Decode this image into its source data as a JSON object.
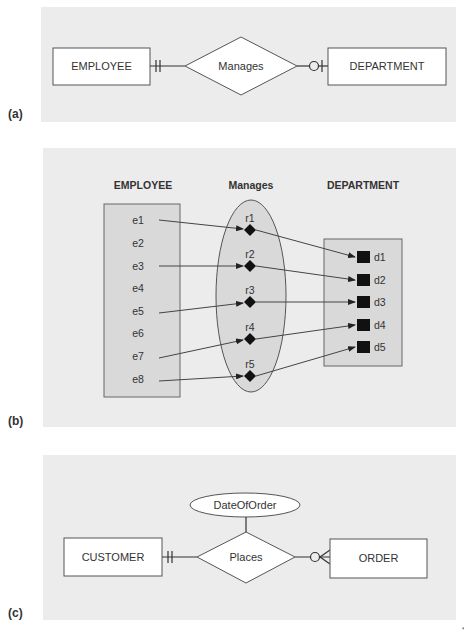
{
  "panels": {
    "a": {
      "label": "(a)",
      "entity_left": "EMPLOYEE",
      "relationship": "Manages",
      "entity_right": "DEPARTMENT",
      "left_cardinality": "one-and-only-one",
      "right_cardinality": "zero-or-one"
    },
    "b": {
      "label": "(b)",
      "headers": {
        "employee": "EMPLOYEE",
        "manages": "Manages",
        "department": "DEPARTMENT"
      },
      "employees": [
        "e1",
        "e2",
        "e3",
        "e4",
        "e5",
        "e6",
        "e7",
        "e8"
      ],
      "relationships": [
        "r1",
        "r2",
        "r3",
        "r4",
        "r5"
      ],
      "departments": [
        "d1",
        "d2",
        "d3",
        "d4",
        "d5"
      ],
      "mappings": [
        {
          "employee": "e1",
          "relationship": "r1",
          "department": "d1"
        },
        {
          "employee": "e3",
          "relationship": "r2",
          "department": "d2"
        },
        {
          "employee": "e5",
          "relationship": "r3",
          "department": "d3"
        },
        {
          "employee": "e7",
          "relationship": "r4",
          "department": "d4"
        },
        {
          "employee": "e8",
          "relationship": "r5",
          "department": "d5"
        }
      ]
    },
    "c": {
      "label": "(c)",
      "entity_left": "CUSTOMER",
      "relationship": "Places",
      "attribute": "DateOfOrder",
      "entity_right": "ORDER",
      "left_cardinality": "one-and-only-one",
      "right_cardinality": "zero-or-many"
    }
  },
  "footer_mark": "‘"
}
